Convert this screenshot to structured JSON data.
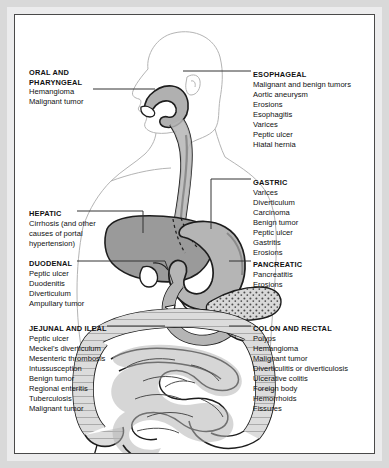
{
  "figure": {
    "colors": {
      "page_border": "#d9d9d9",
      "inner_border": "#4a4a4a",
      "background": "#ffffff",
      "body_outline": "#b0b0b0",
      "organ_dark": "#9a9a9a",
      "organ_mid": "#b5b5b5",
      "organ_light": "#d8d8d8",
      "organ_stroke": "#1d1d1d",
      "leader_line": "#333333",
      "text": "#111111"
    }
  },
  "labels": {
    "oral": {
      "heading_line1": "ORAL AND",
      "heading_line2": "PHARYNGEAL",
      "items": [
        "Hemangioma",
        "Malignant tumor"
      ]
    },
    "hepatic": {
      "heading": "HEPATIC",
      "items": [
        "Cirrhosis (and other causes of portal hypertension)"
      ]
    },
    "duodenal": {
      "heading": "DUODENAL",
      "items": [
        "Peptic ulcer",
        "Duodenitis",
        "Diverticulum",
        "Ampullary tumor"
      ]
    },
    "jejunal": {
      "heading": "JEJUNAL AND ILEAL",
      "items": [
        "Peptic ulcer",
        "Meckel's diverticulum",
        "Mesenteric thrombosis",
        "Intussusception",
        "Benign tumor",
        "Regional enteritis",
        "Tuberculosis",
        "Malignant tumor"
      ]
    },
    "esophageal": {
      "heading": "ESOPHAGEAL",
      "items": [
        "Malignant and benign tumors",
        "Aortic aneurysm",
        "Erosions",
        "Esophagitis",
        "Varices",
        "Peptic ulcer",
        "Hiatal hernia"
      ]
    },
    "gastric": {
      "heading": "GASTRIC",
      "items": [
        "Varices",
        "Diverticulum",
        "Carcinoma",
        "Benign tumor",
        "Peptic ulcer",
        "Gastritis",
        "Erosions"
      ]
    },
    "pancreatic": {
      "heading": "PANCREATIC",
      "items": [
        "Pancreatitis",
        "Erosions"
      ]
    },
    "colon": {
      "heading": "COLON AND RECTAL",
      "items": [
        "Polyps",
        "Hemangioma",
        "Malignant tumor",
        "Diverticulitis or diverticulosis",
        "Ulcerative colitis",
        "Foreign body",
        "Hemorrhoids",
        "Fissures"
      ]
    }
  }
}
